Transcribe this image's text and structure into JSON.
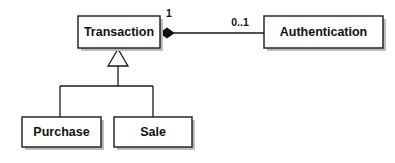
{
  "diagram": {
    "type": "uml-class-diagram",
    "background_color": "#ffffff",
    "line_color": "#1a1a1a",
    "shadow_color": "#bdbdbd",
    "classes": [
      {
        "id": "transaction",
        "name": "Transaction",
        "x": 78,
        "y": 16,
        "width": 82,
        "height": 32
      },
      {
        "id": "authentication",
        "name": "Authentication",
        "x": 264,
        "y": 16,
        "width": 119,
        "height": 32
      },
      {
        "id": "purchase",
        "name": "Purchase",
        "x": 22,
        "y": 117,
        "width": 79,
        "height": 30
      },
      {
        "id": "sale",
        "name": "Sale",
        "x": 114,
        "y": 117,
        "width": 78,
        "height": 30
      }
    ],
    "relationships": [
      {
        "id": "transaction-authentication",
        "kind": "composition",
        "source": "transaction",
        "target": "authentication",
        "source_multiplicity": "1",
        "target_multiplicity": "0..1"
      },
      {
        "id": "transaction-purchase",
        "kind": "generalization",
        "parent": "transaction",
        "child": "purchase"
      },
      {
        "id": "transaction-sale",
        "kind": "generalization",
        "parent": "transaction",
        "child": "sale"
      }
    ],
    "labels": {
      "source_multiplicity": "1",
      "target_multiplicity": "0..1"
    }
  }
}
